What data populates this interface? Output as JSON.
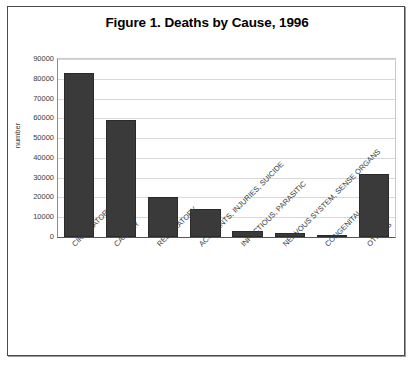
{
  "figure": {
    "title": "Figure 1. Deaths by Cause, 1996",
    "border_color": "#4a4a4a"
  },
  "chart_data": {
    "type": "bar",
    "title": "Figure 1. Deaths by Cause, 1996",
    "xlabel": "",
    "ylabel": "number",
    "categories": [
      "CIRCULATORY",
      "CANCER",
      "RESPIRATORY",
      "ACCIDENTS, INJURIES, SUICIDE",
      "INFECTIOUS, PARASITIC",
      "NERVOUS SYSTEM, SENSE ORGANS",
      "CONGENITAL",
      "OTHERS"
    ],
    "values": [
      83000,
      59000,
      20000,
      14000,
      3000,
      2000,
      1000,
      32000
    ],
    "ylim": [
      0,
      90000
    ],
    "ytick_values": [
      0,
      10000,
      20000,
      30000,
      40000,
      50000,
      60000,
      70000,
      80000,
      90000
    ],
    "ytick_labels": [
      "0",
      "10000",
      "20000",
      "30000",
      "40000",
      "50000",
      "60000",
      "70000",
      "80000",
      "90000"
    ],
    "grid": true,
    "legend": false,
    "bar_color": "#3a3a3a",
    "gridline_color": "#d8d8d8",
    "xtick_rotation": -45
  }
}
